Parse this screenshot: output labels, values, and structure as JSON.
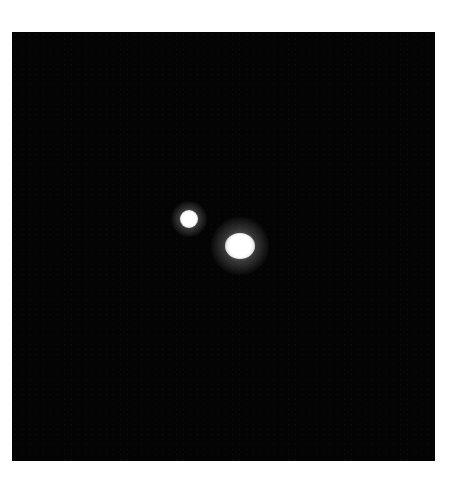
{
  "image": {
    "description": "Dark field with two bright point sources",
    "background_color": "#040404",
    "frame": {
      "left": 12,
      "top": 32,
      "width": 423,
      "height": 429
    },
    "sources": [
      {
        "name": "small-source",
        "cx": 189,
        "cy": 219,
        "core_w": 18,
        "core_h": 18,
        "glow": 36
      },
      {
        "name": "large-source",
        "cx": 240,
        "cy": 246,
        "core_w": 30,
        "core_h": 26,
        "glow": 58
      }
    ]
  }
}
